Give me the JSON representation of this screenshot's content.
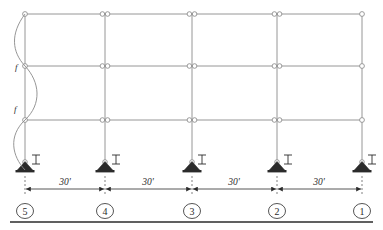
{
  "figure": {
    "name": "multistory-frame-elevation",
    "line_color": "#8a8a8a",
    "ink_color": "#2b2b2b",
    "support_fill": "#2b2b2b"
  },
  "geometry": {
    "column_lines_x": [
      25,
      105,
      192,
      277,
      362
    ],
    "beam_levels_y": [
      14,
      66,
      120
    ],
    "base_y": 170,
    "bays": 4,
    "stories": 3
  },
  "dimensions": {
    "line_y": 189,
    "labels": [
      {
        "text": "30'",
        "x": 65
      },
      {
        "text": "30'",
        "x": 148
      },
      {
        "text": "30'",
        "x": 234
      },
      {
        "text": "30'",
        "x": 319
      }
    ]
  },
  "grid_bubbles": {
    "center_y": 211,
    "rx": 8.5,
    "ry": 7.5,
    "items": [
      {
        "label": "5",
        "x": 25
      },
      {
        "label": "4",
        "x": 105
      },
      {
        "label": "3",
        "x": 192
      },
      {
        "label": "2",
        "x": 277
      },
      {
        "label": "1",
        "x": 362
      }
    ]
  },
  "member_labels": {
    "inertia_symbol": "I",
    "items": [
      {
        "x": 36,
        "y": 161
      },
      {
        "x": 116,
        "y": 161
      },
      {
        "x": 202,
        "y": 161
      },
      {
        "x": 288,
        "y": 161
      },
      {
        "x": 372,
        "y": 161
      }
    ]
  },
  "buckled_shape": {
    "label_upper": "f",
    "label_upper_x": 15,
    "label_upper_y": 70,
    "label_lower": "f",
    "label_lower_x": 14,
    "label_lower_y": 112,
    "path": "M 25 14 C 10 34, 12 52, 25 66 C 40 82, 42 104, 25 120 C 8 136, 12 156, 25 170"
  },
  "footer_rule": {
    "y": 222,
    "x1": 10,
    "x2": 373
  }
}
